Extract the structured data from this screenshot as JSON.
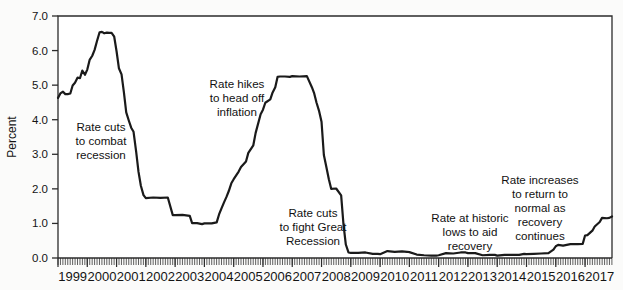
{
  "chart_data": {
    "type": "line",
    "title": "",
    "subtitle": "",
    "xlabel": "",
    "ylabel": "Percent",
    "ylim": [
      0.0,
      7.0
    ],
    "xlim": [
      1999.0,
      2017.92
    ],
    "grid": false,
    "legend": null,
    "y_ticks": [
      "7.0",
      "6.0",
      "5.0",
      "4.0",
      "3.0",
      "2.0",
      "1.0",
      "0.0"
    ],
    "y_tick_values": [
      7.0,
      6.0,
      5.0,
      4.0,
      3.0,
      2.0,
      1.0,
      0.0
    ],
    "x_ticks": [
      "1999",
      "2000",
      "2001",
      "2002",
      "2003",
      "2004",
      "2005",
      "2006",
      "2007",
      "2008",
      "2009",
      "2010",
      "2011",
      "2012",
      "2013",
      "2014",
      "2015",
      "2016",
      "2017"
    ],
    "x_tick_values": [
      1999,
      2000,
      2001,
      2002,
      2003,
      2004,
      2005,
      2006,
      2007,
      2008,
      2009,
      2010,
      2011,
      2012,
      2013,
      2014,
      2015,
      2016,
      2017
    ],
    "minor_tick_interval_months": 1,
    "series": [
      {
        "name": "Federal funds rate",
        "color": "#1a1a1a",
        "x": [
          1999.0,
          1999.08,
          1999.17,
          1999.25,
          1999.33,
          1999.42,
          1999.5,
          1999.58,
          1999.67,
          1999.75,
          1999.83,
          1999.92,
          2000.0,
          2000.08,
          2000.17,
          2000.25,
          2000.33,
          2000.42,
          2000.5,
          2000.58,
          2000.67,
          2000.75,
          2000.83,
          2000.92,
          2001.0,
          2001.08,
          2001.17,
          2001.25,
          2001.33,
          2001.42,
          2001.5,
          2001.58,
          2001.67,
          2001.75,
          2001.83,
          2001.92,
          2002.0,
          2002.25,
          2002.5,
          2002.75,
          2002.92,
          2003.0,
          2003.25,
          2003.5,
          2003.58,
          2003.75,
          2003.92,
          2004.0,
          2004.25,
          2004.42,
          2004.5,
          2004.58,
          2004.67,
          2004.75,
          2004.83,
          2004.92,
          2005.0,
          2005.17,
          2005.25,
          2005.42,
          2005.5,
          2005.67,
          2005.75,
          2005.92,
          2006.0,
          2006.08,
          2006.25,
          2006.33,
          2006.42,
          2006.5,
          2006.58,
          2006.75,
          2006.92,
          2007.0,
          2007.25,
          2007.5,
          2007.67,
          2007.75,
          2007.83,
          2007.92,
          2008.0,
          2008.08,
          2008.17,
          2008.25,
          2008.33,
          2008.5,
          2008.67,
          2008.75,
          2008.83,
          2008.92,
          2009.0,
          2009.25,
          2009.5,
          2009.75,
          2009.92,
          2010.0,
          2010.25,
          2010.5,
          2010.75,
          2010.92,
          2011.0,
          2011.25,
          2011.5,
          2011.75,
          2011.92,
          2012.0,
          2012.25,
          2012.5,
          2012.75,
          2012.92,
          2013.0,
          2013.25,
          2013.5,
          2013.75,
          2013.92,
          2014.0,
          2014.25,
          2014.5,
          2014.75,
          2014.92,
          2015.0,
          2015.25,
          2015.5,
          2015.75,
          2015.92,
          2016.0,
          2016.08,
          2016.25,
          2016.5,
          2016.75,
          2016.92,
          2017.0,
          2017.08,
          2017.25,
          2017.33,
          2017.5,
          2017.58,
          2017.75,
          2017.83,
          2017.92
        ],
        "y": [
          4.63,
          4.76,
          4.81,
          4.74,
          4.74,
          4.76,
          4.99,
          5.07,
          5.22,
          5.2,
          5.42,
          5.3,
          5.45,
          5.73,
          5.85,
          6.02,
          6.27,
          6.53,
          6.54,
          6.5,
          6.52,
          6.51,
          6.51,
          6.4,
          5.98,
          5.49,
          5.31,
          4.8,
          4.21,
          3.97,
          3.77,
          3.65,
          3.07,
          2.49,
          2.09,
          1.82,
          1.73,
          1.75,
          1.74,
          1.75,
          1.24,
          1.24,
          1.25,
          1.22,
          1.01,
          1.01,
          0.98,
          1.0,
          1.0,
          1.03,
          1.26,
          1.43,
          1.61,
          1.76,
          1.93,
          2.16,
          2.28,
          2.5,
          2.63,
          2.79,
          3.04,
          3.26,
          3.62,
          4.16,
          4.29,
          4.49,
          4.59,
          4.79,
          4.94,
          5.24,
          5.25,
          5.25,
          5.24,
          5.26,
          5.25,
          5.26,
          4.94,
          4.76,
          4.49,
          4.24,
          3.94,
          2.98,
          2.61,
          2.28,
          2.0,
          2.01,
          1.81,
          0.97,
          0.39,
          0.16,
          0.15,
          0.15,
          0.16,
          0.12,
          0.12,
          0.11,
          0.2,
          0.18,
          0.19,
          0.18,
          0.17,
          0.1,
          0.08,
          0.07,
          0.07,
          0.08,
          0.14,
          0.13,
          0.16,
          0.16,
          0.14,
          0.14,
          0.08,
          0.09,
          0.09,
          0.07,
          0.09,
          0.09,
          0.09,
          0.12,
          0.11,
          0.12,
          0.13,
          0.14,
          0.24,
          0.34,
          0.38,
          0.36,
          0.4,
          0.4,
          0.41,
          0.65,
          0.66,
          0.79,
          0.91,
          1.04,
          1.16,
          1.15,
          1.16,
          1.2
        ]
      }
    ],
    "annotations": [
      {
        "id": "anno-rate-cuts-recession",
        "lines": [
          "Rate cuts",
          "to combat",
          "recession"
        ],
        "x_px": 101,
        "y_px": 131
      },
      {
        "id": "anno-rate-hikes-inflation",
        "lines": [
          "Rate hikes",
          "to head off",
          "inflation"
        ],
        "x_px": 237,
        "y_px": 88
      },
      {
        "id": "anno-rate-cuts-great-recession",
        "lines": [
          "Rate cuts",
          "to fight Great",
          "Recession"
        ],
        "x_px": 313,
        "y_px": 217
      },
      {
        "id": "anno-rate-historic-lows",
        "lines": [
          "Rate at historic",
          "lows to aid",
          "recovery"
        ],
        "x_px": 470,
        "y_px": 222
      },
      {
        "id": "anno-rate-increases-normal",
        "lines": [
          "Rate increases",
          "to return to",
          "normal as",
          "recovery",
          "continues"
        ],
        "x_px": 540,
        "y_px": 184
      }
    ]
  },
  "colors": {
    "line": "#1a1a1a",
    "axis": "#2b2b2b",
    "text": "#141414",
    "background": "#fbfbfa",
    "plot_background": "#ffffff"
  }
}
